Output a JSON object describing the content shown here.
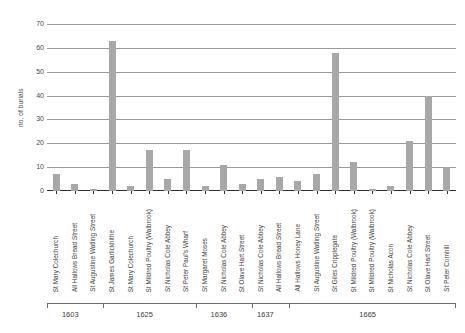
{
  "chart_data": {
    "type": "bar",
    "title": "",
    "xlabel": "",
    "ylabel": "no. of burials",
    "ylim": [
      0,
      70
    ],
    "ytick_labels": [
      "0",
      "10",
      "20",
      "30",
      "40",
      "50",
      "60",
      "70"
    ],
    "ytick_values": [
      0,
      10,
      20,
      30,
      40,
      50,
      60,
      70
    ],
    "grid": true,
    "legend": "none",
    "bar_color": "#a8a8a8",
    "categories": [
      "St Mary Colechurch",
      "All Hallows Bread Street",
      "St Augustine Watling Street",
      "St James Garlickhithe",
      "St Mary Colechurch",
      "St Mildred Poultry (Walbrook)",
      "St Nicholas Cole Abbey",
      "St Peter Paul's Wharf",
      "St Margaret Moses",
      "St Nicholas Cole Abbey",
      "St Olave Hart Street",
      "St Nicholas Cole Abbey",
      "All Hallows Bread Street",
      "All Hallows Honey Lane",
      "St Augustine Watling Street",
      "St Giles Cripplegate",
      "St Mildred Poultry (Walbrook)",
      "St Mildred Poultry (Walbrook)",
      "St Nicholas Acon",
      "St Nicholas Cole Abbey",
      "St Olave Hart Street",
      "St Peter Cornhill"
    ],
    "values": [
      7,
      3,
      1,
      63,
      2,
      17,
      5,
      17,
      2,
      11,
      3,
      5,
      6,
      4,
      7,
      58,
      12,
      1,
      2,
      21,
      40,
      10
    ],
    "group_axis": {
      "label": "year",
      "tick_labels": [
        "1603",
        "1625",
        "1636",
        "1637",
        "1665"
      ],
      "groups": [
        {
          "year": "1603",
          "count": 3
        },
        {
          "year": "1625",
          "count": 5
        },
        {
          "year": "1636",
          "count": 3
        },
        {
          "year": "1637",
          "count": 2
        },
        {
          "year": "1665",
          "count": 9
        }
      ]
    }
  }
}
